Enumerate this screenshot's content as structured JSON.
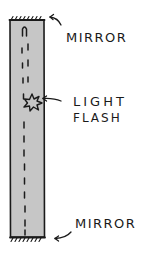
{
  "diagram": {
    "labels": {
      "top_mirror": "MIRROR",
      "light": "LIGHT",
      "flash": "FLASH",
      "bottom_mirror": "MIRROR"
    },
    "colors": {
      "tube_fill": "#c6c6c6",
      "stroke": "#1a1a1a",
      "background": "#ffffff"
    },
    "elements": [
      {
        "id": "tube",
        "type": "rectangle"
      },
      {
        "id": "top-mirror",
        "type": "hatched-surface"
      },
      {
        "id": "bottom-mirror",
        "type": "hatched-surface"
      },
      {
        "id": "light-path",
        "type": "dashed-line"
      },
      {
        "id": "light-flash",
        "type": "starburst"
      },
      {
        "id": "arrow-top-mirror",
        "type": "curved-arrow"
      },
      {
        "id": "arrow-light-flash",
        "type": "arrow"
      },
      {
        "id": "arrow-bottom-mirror",
        "type": "curved-arrow"
      }
    ]
  }
}
